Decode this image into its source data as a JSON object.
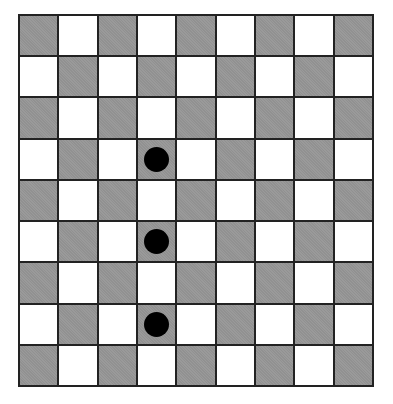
{
  "board": {
    "rows": 9,
    "cols": 9,
    "colors": {
      "dark": "#9a9a9a",
      "light": "#ffffff",
      "grid": "#222222",
      "dot": "#000000"
    },
    "top_left_dark": true,
    "dots": [
      {
        "row": 3,
        "col": 3
      },
      {
        "row": 5,
        "col": 3
      },
      {
        "row": 7,
        "col": 3
      }
    ]
  }
}
